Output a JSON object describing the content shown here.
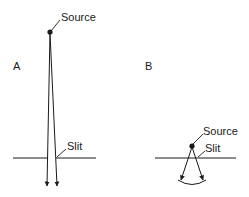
{
  "figure": {
    "panels": [
      {
        "id": "A",
        "label": "A",
        "source_label": "Source",
        "slit_label": "Slit"
      },
      {
        "id": "B",
        "label": "B",
        "source_label": "Source",
        "slit_label": "Slit"
      }
    ],
    "colors": {
      "ink": "#1a1a1a",
      "background": "#ffffff"
    }
  }
}
